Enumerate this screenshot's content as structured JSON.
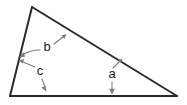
{
  "figure": {
    "type": "geometry-diagram",
    "background_color": "#ffffff",
    "line_color": "#2b2b2b",
    "leader_color": "#7d7d7d",
    "label_color": "#1a1a1a",
    "triangle": {
      "vertices": [
        {
          "name": "apex",
          "x": 32,
          "y": 7
        },
        {
          "name": "bottom-left",
          "x": 10,
          "y": 96
        },
        {
          "name": "bottom-right",
          "x": 177,
          "y": 96
        }
      ]
    },
    "labels": [
      {
        "id": "a",
        "text": "a",
        "x": 112,
        "y": 75,
        "pointers": [
          {
            "target": "hypotenuse",
            "direction": "up-right"
          },
          {
            "target": "base",
            "direction": "down"
          }
        ]
      },
      {
        "id": "b",
        "text": "b",
        "x": 47,
        "y": 48,
        "pointers": [
          {
            "target": "hypotenuse",
            "direction": "up-right"
          },
          {
            "target": "left-side",
            "direction": "left"
          }
        ]
      },
      {
        "id": "c",
        "text": "c",
        "x": 40,
        "y": 72,
        "pointers": [
          {
            "target": "left-side",
            "direction": "up-left"
          },
          {
            "target": "base",
            "direction": "down"
          }
        ]
      }
    ]
  }
}
